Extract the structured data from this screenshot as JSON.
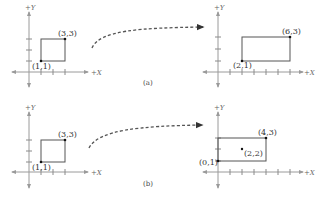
{
  "figure": {
    "panels": [
      {
        "caption": "(a)",
        "before": {
          "x_axis_label": "+X",
          "y_axis_label": "+Y",
          "rect_corners": [
            [
              1,
              1
            ],
            [
              3,
              3
            ]
          ],
          "labels": [
            "(1,1)",
            "(3,3)"
          ]
        },
        "after": {
          "x_axis_label": "+X",
          "y_axis_label": "+Y",
          "rect_corners": [
            [
              2,
              1
            ],
            [
              6,
              3
            ]
          ],
          "labels": [
            "(2,1)",
            "(6,3)"
          ]
        }
      },
      {
        "caption": "(b)",
        "before": {
          "x_axis_label": "+X",
          "y_axis_label": "+Y",
          "rect_corners": [
            [
              1,
              1
            ],
            [
              3,
              3
            ]
          ],
          "labels": [
            "(1,1)",
            "(3,3)"
          ]
        },
        "after": {
          "x_axis_label": "+X",
          "y_axis_label": "+Y",
          "rect_corners": [
            [
              0,
              1
            ],
            [
              4,
              3
            ]
          ],
          "labels": [
            "(0,1)",
            "(4,3)"
          ],
          "center_point": [
            2,
            2
          ],
          "center_label": "(2,2)"
        }
      }
    ],
    "arrow_style": "dashed-curve",
    "colors": {
      "axis": "#9a9a9a",
      "rect": "#555555",
      "point": "#111111",
      "text": "#333333"
    }
  }
}
